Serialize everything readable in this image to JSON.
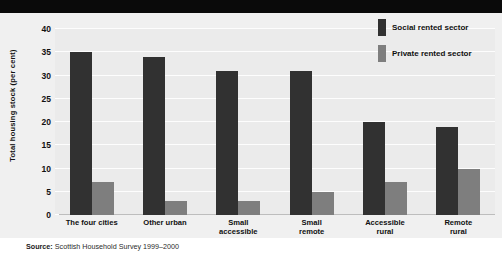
{
  "title_band": {
    "title": ""
  },
  "legend": {
    "position": "top-right",
    "entries": [
      {
        "label": "Social rented sector",
        "color": "#313131",
        "key": "social"
      },
      {
        "label": "Private rented sector",
        "color": "#7e7e7e",
        "key": "private"
      }
    ]
  },
  "source": {
    "prefix": "Source:",
    "text": "Scottish Household Survey 1999–2000"
  },
  "chart_data": {
    "type": "bar",
    "title": "",
    "xlabel": "",
    "ylabel": "Total housing stock (per cent)",
    "ylim": [
      0,
      40
    ],
    "yticks": [
      0,
      5,
      10,
      15,
      20,
      25,
      30,
      35,
      40
    ],
    "grid": true,
    "legend_position": "top-right",
    "categories": [
      "The four cities",
      "Other urban",
      "Small accessible",
      "Small remote",
      "Accessible rural",
      "Remote rural"
    ],
    "category_lines": [
      [
        "The four cities"
      ],
      [
        "Other urban"
      ],
      [
        "Small",
        "accessible"
      ],
      [
        "Small",
        "remote"
      ],
      [
        "Accessible",
        "rural"
      ],
      [
        "Remote",
        "rural"
      ]
    ],
    "series": [
      {
        "name": "Social rented sector",
        "color": "#313131",
        "values": [
          35,
          34,
          31,
          31,
          20,
          19
        ]
      },
      {
        "name": "Private rented sector",
        "color": "#7e7e7e",
        "values": [
          7,
          3,
          3,
          5,
          7,
          10
        ]
      }
    ]
  }
}
